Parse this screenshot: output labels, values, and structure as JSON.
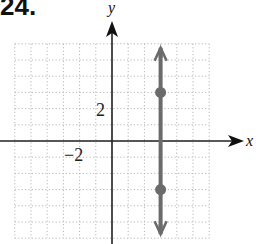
{
  "problem_number": "24.",
  "chart_data": {
    "type": "line",
    "title": "",
    "xlabel": "x",
    "ylabel": "y",
    "xlim": [
      -6,
      6
    ],
    "ylim": [
      -6,
      6
    ],
    "grid": true,
    "grid_style": "dotted",
    "tick_labels": [
      {
        "axis": "y",
        "value": 2,
        "label": "2"
      },
      {
        "axis": "x",
        "value": -2,
        "label": "−2"
      }
    ],
    "series": [
      {
        "name": "vertical line x = 3",
        "equation": "x = 3",
        "x": [
          3,
          3
        ],
        "y": [
          -6,
          6
        ],
        "arrows_both_ends": true,
        "marked_points": [
          {
            "x": 3,
            "y": 3
          },
          {
            "x": 3,
            "y": -3
          }
        ]
      }
    ]
  },
  "colors": {
    "axis": "#222222",
    "grid": "#b8b8b8",
    "line": "#6b6b6b",
    "point": "#6b6b6b"
  }
}
